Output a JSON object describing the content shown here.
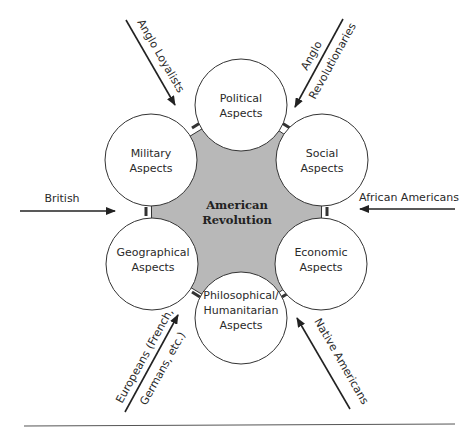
{
  "diagram": {
    "center": {
      "line1": "American",
      "line2": "Revolution",
      "fill": "#b8b8b8"
    },
    "aspects": [
      {
        "id": "political",
        "line1": "Political",
        "line2": "Aspects",
        "line3": ""
      },
      {
        "id": "military",
        "line1": "Military",
        "line2": "Aspects",
        "line3": ""
      },
      {
        "id": "social",
        "line1": "Social",
        "line2": "Aspects",
        "line3": ""
      },
      {
        "id": "geographical",
        "line1": "Geographical",
        "line2": "Aspects",
        "line3": ""
      },
      {
        "id": "economic",
        "line1": "Economic",
        "line2": "Aspects",
        "line3": ""
      },
      {
        "id": "philosophical",
        "line1": "Philosophical/",
        "line2": "Humanitarian",
        "line3": "Aspects"
      }
    ],
    "influences": [
      {
        "id": "anglo-loyalists",
        "line1": "Anglo Loyalists",
        "line2": ""
      },
      {
        "id": "anglo-revolutionaries",
        "line1": "Anglo",
        "line2": "Revolutionaries"
      },
      {
        "id": "british",
        "line1": "British",
        "line2": ""
      },
      {
        "id": "african-americans",
        "line1": "African Americans",
        "line2": ""
      },
      {
        "id": "europeans",
        "line1": "Europeans (French,",
        "line2": "Germans, etc.)"
      },
      {
        "id": "native-americans",
        "line1": "Native Americans",
        "line2": ""
      }
    ]
  }
}
